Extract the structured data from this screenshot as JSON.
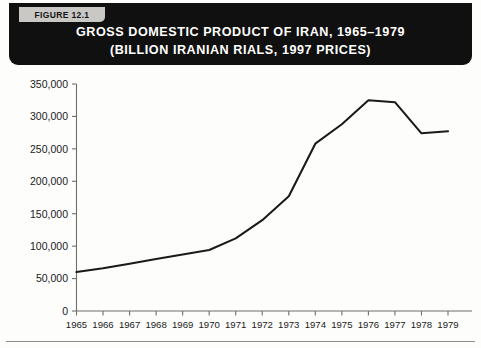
{
  "figure": {
    "badge_label": "FIGURE 12.1",
    "title_line_1": "GROSS DOMESTIC PRODUCT OF IRAN, 1965–1979",
    "title_line_2": "(BILLION IRANIAN RIALS, 1997 PRICES)"
  },
  "colors": {
    "banner_background": "#111010",
    "banner_text": "#ffffff",
    "badge_background": "#c9c8c4",
    "badge_text": "#151515",
    "line": "#1a1a1a",
    "axis": "#6f6f6f",
    "page_background": "#fdfdfc"
  },
  "chart_data": {
    "type": "line",
    "title": "GROSS DOMESTIC PRODUCT OF IRAN, 1965–1979 (BILLION IRANIAN RIALS, 1997 PRICES)",
    "xlabel": "",
    "ylabel": "",
    "grid": false,
    "legend": false,
    "legend_position": "none",
    "xlim": [
      1965,
      1979
    ],
    "ylim": [
      0,
      350000
    ],
    "ytick_labels": [
      "350,000",
      "300,000",
      "250,000",
      "200,000",
      "150,000",
      "100,000",
      "50,000",
      "0"
    ],
    "ytick_values": [
      350000,
      300000,
      250000,
      200000,
      150000,
      100000,
      50000,
      0
    ],
    "categories": [
      1965,
      1966,
      1967,
      1968,
      1969,
      1970,
      1971,
      1972,
      1973,
      1974,
      1975,
      1976,
      1977,
      1978,
      1979
    ],
    "xtick_labels": [
      "1965",
      "1966",
      "1967",
      "1968",
      "1969",
      "1970",
      "1971",
      "1972",
      "1973",
      "1974",
      "1975",
      "1976",
      "1977",
      "1978",
      "1979"
    ],
    "series": [
      {
        "name": "Gross Domestic Product of Iran",
        "values": [
          60000,
          66000,
          73000,
          80000,
          87000,
          94000,
          112000,
          140000,
          177000,
          258000,
          288000,
          325000,
          322000,
          274000,
          277000
        ]
      }
    ]
  }
}
